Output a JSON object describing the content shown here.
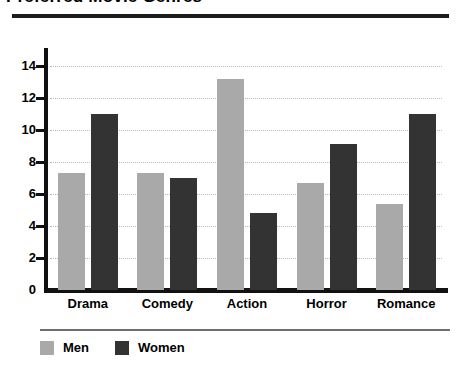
{
  "chart_data": {
    "type": "bar",
    "title": "Preferred Movie Genres",
    "xlabel": "",
    "ylabel": "",
    "categories": [
      "Drama",
      "Comedy",
      "Action",
      "Horror",
      "Romance"
    ],
    "series": [
      {
        "name": "Men",
        "color": "#a9a9a9",
        "values": [
          7.3,
          7.3,
          13.2,
          6.7,
          5.4
        ]
      },
      {
        "name": "Women",
        "color": "#333333",
        "values": [
          11.0,
          7.0,
          4.8,
          9.1,
          11.0
        ]
      }
    ],
    "ylim": [
      0,
      15
    ],
    "yticks": [
      0,
      2,
      4,
      6,
      8,
      10,
      12,
      14
    ],
    "ytick_labels": [
      "0",
      "2",
      "4",
      "6",
      "8",
      "10",
      "12",
      "14"
    ],
    "grid": true,
    "grid_style": "dotted",
    "legend_position": "bottom-left"
  },
  "legend": {
    "items": [
      {
        "label": "Men",
        "color": "#a9a9a9"
      },
      {
        "label": "Women",
        "color": "#333333"
      }
    ]
  },
  "colors": {
    "men": "#a9a9a9",
    "women": "#333333",
    "axis": "#111111",
    "grid": "#b9b9b9",
    "rule": "#1c1c1c"
  }
}
